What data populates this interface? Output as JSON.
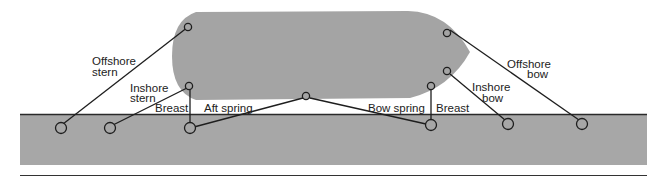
{
  "colors": {
    "hull": "#a4a4a4",
    "dock": "#a7a7a7",
    "line": "#1e1e1e",
    "background": "#ffffff"
  },
  "labels": {
    "offshore_stern": [
      "Offshore",
      "stern"
    ],
    "inshore_stern": [
      "Inshore",
      "stern"
    ],
    "breast_aft": "Breast",
    "aft_spring": "Aft spring",
    "bow_spring": "Bow spring",
    "breast_fwd": "Breast",
    "inshore_bow": [
      "Inshore",
      "bow"
    ],
    "offshore_bow": [
      "Offshore",
      "bow"
    ]
  }
}
